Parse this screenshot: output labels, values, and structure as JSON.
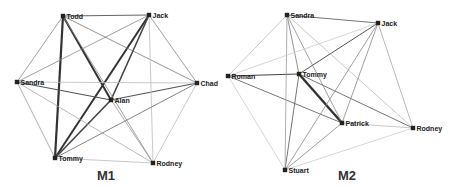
{
  "panels": [
    {
      "id": "M1",
      "label": "M1",
      "label_pos": [
        97,
        180
      ],
      "nodes": [
        {
          "id": "Todd",
          "label": "Todd",
          "x": 63,
          "y": 16
        },
        {
          "id": "Jack",
          "label": "Jack",
          "x": 149,
          "y": 15
        },
        {
          "id": "Sandra",
          "label": "Sandra",
          "x": 17,
          "y": 82
        },
        {
          "id": "Chad",
          "label": "Chad",
          "x": 197,
          "y": 83
        },
        {
          "id": "Alan",
          "label": "Alan",
          "x": 111,
          "y": 100
        },
        {
          "id": "Tommy",
          "label": "Tommy",
          "x": 55,
          "y": 158
        },
        {
          "id": "Rodney",
          "label": "Rodney",
          "x": 153,
          "y": 163
        }
      ],
      "edges": [
        {
          "from": "Todd",
          "to": "Tommy",
          "w": 2.2,
          "c": "#333333"
        },
        {
          "from": "Todd",
          "to": "Alan",
          "w": 2.0,
          "c": "#333333"
        },
        {
          "from": "Jack",
          "to": "Tommy",
          "w": 2.0,
          "c": "#333333"
        },
        {
          "from": "Jack",
          "to": "Alan",
          "w": 1.6,
          "c": "#444444"
        },
        {
          "from": "Alan",
          "to": "Tommy",
          "w": 1.6,
          "c": "#444444"
        },
        {
          "from": "Sandra",
          "to": "Alan",
          "w": 1.2,
          "c": "#555555"
        },
        {
          "from": "Alan",
          "to": "Chad",
          "w": 1.2,
          "c": "#555555"
        },
        {
          "from": "Todd",
          "to": "Jack",
          "w": 1.0,
          "c": "#666666"
        },
        {
          "from": "Todd",
          "to": "Sandra",
          "w": 0.8,
          "c": "#888888"
        },
        {
          "from": "Todd",
          "to": "Chad",
          "w": 0.8,
          "c": "#777777"
        },
        {
          "from": "Todd",
          "to": "Rodney",
          "w": 0.8,
          "c": "#888888"
        },
        {
          "from": "Jack",
          "to": "Sandra",
          "w": 0.8,
          "c": "#888888"
        },
        {
          "from": "Jack",
          "to": "Chad",
          "w": 0.8,
          "c": "#888888"
        },
        {
          "from": "Jack",
          "to": "Rodney",
          "w": 0.8,
          "c": "#bbbbbb"
        },
        {
          "from": "Sandra",
          "to": "Chad",
          "w": 0.8,
          "c": "#bbbbbb"
        },
        {
          "from": "Sandra",
          "to": "Tommy",
          "w": 0.8,
          "c": "#999999"
        },
        {
          "from": "Sandra",
          "to": "Rodney",
          "w": 0.8,
          "c": "#aaaaaa"
        },
        {
          "from": "Chad",
          "to": "Tommy",
          "w": 0.9,
          "c": "#777777"
        },
        {
          "from": "Chad",
          "to": "Rodney",
          "w": 0.8,
          "c": "#bbbbbb"
        },
        {
          "from": "Alan",
          "to": "Rodney",
          "w": 0.8,
          "c": "#999999"
        },
        {
          "from": "Tommy",
          "to": "Rodney",
          "w": 0.8,
          "c": "#bbbbbb"
        }
      ]
    },
    {
      "id": "M2",
      "label": "M2",
      "label_pos": [
        338,
        180
      ],
      "nodes": [
        {
          "id": "Sandra",
          "label": "Sandra",
          "x": 287,
          "y": 15
        },
        {
          "id": "Jack",
          "label": "Jack",
          "x": 378,
          "y": 23
        },
        {
          "id": "Roman",
          "label": "Roman",
          "x": 228,
          "y": 76
        },
        {
          "id": "Tommy",
          "label": "Tommy",
          "x": 299,
          "y": 74
        },
        {
          "id": "Patrick",
          "label": "Patrick",
          "x": 342,
          "y": 123
        },
        {
          "id": "Rodney",
          "label": "Rodney",
          "x": 413,
          "y": 128
        },
        {
          "id": "Stuart",
          "label": "Stuart",
          "x": 285,
          "y": 170
        }
      ],
      "edges": [
        {
          "from": "Tommy",
          "to": "Patrick",
          "w": 2.4,
          "c": "#333333"
        },
        {
          "from": "Roman",
          "to": "Tommy",
          "w": 1.2,
          "c": "#444444"
        },
        {
          "from": "Tommy",
          "to": "Jack",
          "w": 1.0,
          "c": "#555555"
        },
        {
          "from": "Sandra",
          "to": "Jack",
          "w": 0.9,
          "c": "#666666"
        },
        {
          "from": "Roman",
          "to": "Patrick",
          "w": 0.9,
          "c": "#666666"
        },
        {
          "from": "Tommy",
          "to": "Rodney",
          "w": 0.9,
          "c": "#666666"
        },
        {
          "from": "Tommy",
          "to": "Stuart",
          "w": 0.9,
          "c": "#666666"
        },
        {
          "from": "Sandra",
          "to": "Tommy",
          "w": 0.8,
          "c": "#777777"
        },
        {
          "from": "Sandra",
          "to": "Patrick",
          "w": 0.8,
          "c": "#888888"
        },
        {
          "from": "Sandra",
          "to": "Stuart",
          "w": 0.8,
          "c": "#999999"
        },
        {
          "from": "Sandra",
          "to": "Rodney",
          "w": 0.8,
          "c": "#bbbbbb"
        },
        {
          "from": "Sandra",
          "to": "Roman",
          "w": 0.8,
          "c": "#bbbbbb"
        },
        {
          "from": "Jack",
          "to": "Patrick",
          "w": 0.8,
          "c": "#888888"
        },
        {
          "from": "Jack",
          "to": "Stuart",
          "w": 0.8,
          "c": "#888888"
        },
        {
          "from": "Jack",
          "to": "Rodney",
          "w": 0.8,
          "c": "#aaaaaa"
        },
        {
          "from": "Jack",
          "to": "Roman",
          "w": 0.8,
          "c": "#cccccc"
        },
        {
          "from": "Patrick",
          "to": "Stuart",
          "w": 0.8,
          "c": "#888888"
        },
        {
          "from": "Patrick",
          "to": "Rodney",
          "w": 0.8,
          "c": "#bbbbbb"
        },
        {
          "from": "Roman",
          "to": "Stuart",
          "w": 0.8,
          "c": "#cccccc"
        },
        {
          "from": "Stuart",
          "to": "Rodney",
          "w": 0.8,
          "c": "#cccccc"
        }
      ]
    }
  ]
}
